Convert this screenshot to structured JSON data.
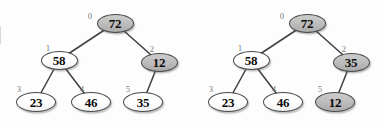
{
  "figure": {
    "type": "binary-heap-tree-pair",
    "background_color": "#fdfdfd",
    "node_white_color": "#ffffff",
    "node_shaded_color": "#bcbcbc",
    "edge_color": "#3f3f3f",
    "index_label_color": "#6e6e6e"
  },
  "trees": [
    {
      "name": "tree-before",
      "nodes": [
        {
          "index": "0",
          "value": "72",
          "shaded": true,
          "level": "root",
          "cx": 115,
          "cy": 23,
          "ix": 88,
          "iy": 13
        },
        {
          "index": "1",
          "value": "58",
          "shaded": false,
          "level": "mid",
          "cx": 59,
          "cy": 60,
          "ix": 46,
          "iy": 45
        },
        {
          "index": "2",
          "value": "12",
          "shaded": true,
          "level": "mid",
          "cx": 159,
          "cy": 62,
          "ix": 150,
          "iy": 46
        },
        {
          "index": "3",
          "value": "23",
          "shaded": false,
          "level": "leaf",
          "cx": 36,
          "cy": 102,
          "ix": 17,
          "iy": 86
        },
        {
          "index": "4",
          "value": "46",
          "shaded": false,
          "level": "leaf",
          "cx": 91,
          "cy": 102,
          "ix": 80,
          "iy": 86
        },
        {
          "index": "5",
          "value": "35",
          "shaded": false,
          "level": "leaf",
          "cx": 143,
          "cy": 102,
          "ix": 126,
          "iy": 86
        }
      ],
      "edges": [
        {
          "from": "0",
          "to": "1"
        },
        {
          "from": "0",
          "to": "2"
        },
        {
          "from": "1",
          "to": "3"
        },
        {
          "from": "1",
          "to": "4"
        },
        {
          "from": "2",
          "to": "5"
        }
      ]
    },
    {
      "name": "tree-after",
      "nodes": [
        {
          "index": "0",
          "value": "72",
          "shaded": true,
          "level": "root",
          "cx": 115,
          "cy": 23,
          "ix": 88,
          "iy": 13
        },
        {
          "index": "1",
          "value": "58",
          "shaded": false,
          "level": "mid",
          "cx": 59,
          "cy": 60,
          "ix": 46,
          "iy": 45
        },
        {
          "index": "2",
          "value": "35",
          "shaded": true,
          "level": "mid",
          "cx": 159,
          "cy": 62,
          "ix": 150,
          "iy": 46
        },
        {
          "index": "3",
          "value": "23",
          "shaded": false,
          "level": "leaf",
          "cx": 36,
          "cy": 102,
          "ix": 17,
          "iy": 86
        },
        {
          "index": "4",
          "value": "46",
          "shaded": false,
          "level": "leaf",
          "cx": 91,
          "cy": 102,
          "ix": 80,
          "iy": 86
        },
        {
          "index": "5",
          "value": "12",
          "shaded": true,
          "level": "leaf",
          "cx": 143,
          "cy": 102,
          "ix": 126,
          "iy": 86
        }
      ],
      "edges": [
        {
          "from": "0",
          "to": "1"
        },
        {
          "from": "0",
          "to": "2"
        },
        {
          "from": "1",
          "to": "3"
        },
        {
          "from": "1",
          "to": "4"
        },
        {
          "from": "2",
          "to": "5"
        }
      ]
    }
  ]
}
